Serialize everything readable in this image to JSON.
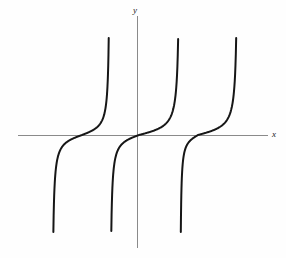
{
  "figure": {
    "title": "",
    "background_color": "#fefefe",
    "width": 286,
    "height": 258
  },
  "axes": {
    "x_axis": {
      "label": "x",
      "color": "#8a8a8a",
      "line_width": 1,
      "pixel_y": 135,
      "pixel_x_start": 18,
      "pixel_x_end": 268
    },
    "y_axis": {
      "label": "y",
      "color": "#8a8a8a",
      "line_width": 1,
      "pixel_x": 137,
      "pixel_y_start": 16,
      "pixel_y_end": 248
    }
  },
  "chart_data": {
    "type": "line",
    "title": "",
    "xlabel": "x",
    "ylabel": "y",
    "function": "y = tan(x)",
    "curve_color": "#161616",
    "curve_width": 2,
    "grid": false,
    "legend": null,
    "xlim": [
      -2.37,
      2.26
    ],
    "ylim": [
      -1.71,
      1.71
    ],
    "x_zero_crossings": [
      -0.98,
      0.0,
      1.03
    ],
    "asymptotes": [
      -1.47,
      -0.47,
      0.74,
      1.74
    ],
    "series": [
      {
        "name": "branch-left",
        "zero_crossing_px": 82,
        "asymptote_left_px": 52,
        "asymptote_right_px": 110,
        "top_px": 37,
        "bottom_px": 233
      },
      {
        "name": "branch-center",
        "zero_crossing_px": 139,
        "asymptote_left_px": 110,
        "asymptote_right_px": 180,
        "top_px": 38,
        "bottom_px": 233
      },
      {
        "name": "branch-right",
        "zero_crossing_px": 198,
        "asymptote_left_px": 180,
        "asymptote_right_px": 238,
        "top_px": 37,
        "bottom_px": 235
      }
    ]
  }
}
